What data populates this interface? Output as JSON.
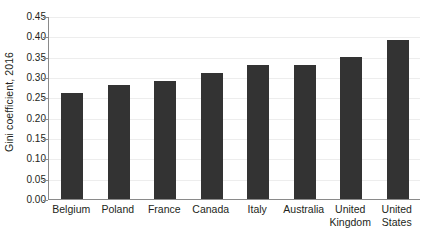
{
  "chart_data": {
    "type": "bar",
    "title": "",
    "subtitle": "",
    "xlabel": "",
    "ylabel": "Gini coefficient, 2016",
    "categories": [
      "Belgium",
      "Poland",
      "France",
      "Canada",
      "Italy",
      "Australia",
      "United Kingdom",
      "United States"
    ],
    "values": [
      0.26,
      0.28,
      0.29,
      0.31,
      0.33,
      0.33,
      0.35,
      0.39
    ],
    "ylim": [
      0.0,
      0.45
    ],
    "ytick_step": 0.05,
    "ytick_labels": [
      "0.45",
      "0.40",
      "0.35",
      "0.30",
      "0.25",
      "0.20",
      "0.15",
      "0.10",
      "0.05",
      "0.00"
    ],
    "ytick_values": [
      0.45,
      0.4,
      0.35,
      0.3,
      0.25,
      0.2,
      0.15,
      0.1,
      0.05,
      0.0
    ],
    "grid": true,
    "grid_axis": "y",
    "legend": false,
    "legend_position": "none",
    "bar_color": "#333333",
    "axis_color": "#8a8a8a",
    "grid_color": "#ededed",
    "text_color": "#231f20",
    "background_color": "#ffffff"
  }
}
